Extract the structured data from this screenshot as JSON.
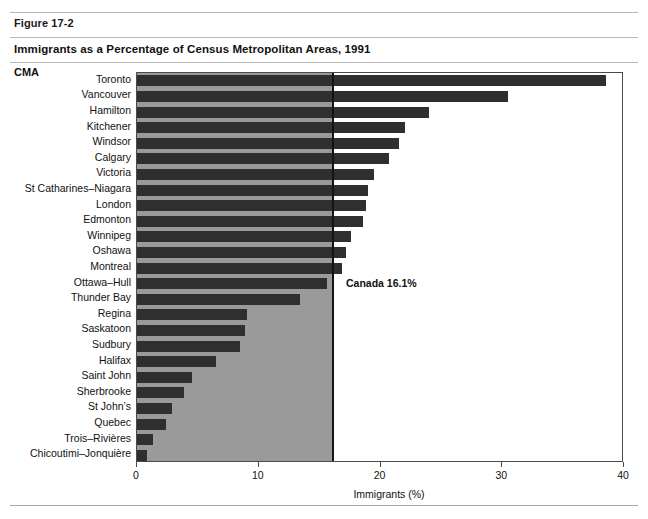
{
  "header": {
    "figure_number": "Figure 17-2",
    "title": "Immigrants as a Percentage of Census Metropolitan Areas, 1991",
    "group_label": "CMA"
  },
  "colors": {
    "bar": "#2f2f2f",
    "shade": "#9a9a9a",
    "average_line": "#141414",
    "frame": "#4a4a4a",
    "rule": "#b9b9b9"
  },
  "annotation": {
    "average_label": "Canada 16.1%"
  },
  "chart_data": {
    "type": "bar",
    "orientation": "horizontal",
    "title": "Immigrants as a Percentage of Census Metropolitan Areas, 1991",
    "xlabel": "Immigrants (%)",
    "ylabel": "CMA",
    "xlim": [
      0,
      40
    ],
    "xticks": [
      0,
      10,
      20,
      30,
      40
    ],
    "xticklabels": [
      "0",
      "10",
      "20",
      "30",
      "40"
    ],
    "grid": false,
    "legend": false,
    "reference_line": {
      "value": 16.1,
      "label": "Canada 16.1%",
      "shade_below": true
    },
    "categories": [
      "Toronto",
      "Vancouver",
      "Hamilton",
      "Kitchener",
      "Windsor",
      "Calgary",
      "Victoria",
      "St Catharines–Niagara",
      "London",
      "Edmonton",
      "Winnipeg",
      "Oshawa",
      "Montreal",
      "Ottawa–Hull",
      "Thunder Bay",
      "Regina",
      "Saskatoon",
      "Sudbury",
      "Halifax",
      "Saint John",
      "Sherbrooke",
      "St John’s",
      "Quebec",
      "Trois–Rivières",
      "Chicoutimi–Jonquière"
    ],
    "values": [
      38.5,
      30.5,
      24.0,
      22.0,
      21.5,
      20.7,
      19.5,
      19.0,
      18.8,
      18.6,
      17.6,
      17.2,
      16.8,
      15.6,
      13.4,
      9.0,
      8.9,
      8.5,
      6.5,
      4.5,
      3.9,
      2.9,
      2.4,
      1.3,
      0.8
    ]
  }
}
